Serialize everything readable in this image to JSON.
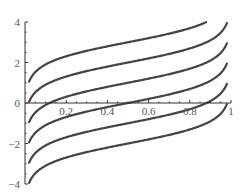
{
  "chart_data": {
    "type": "line",
    "title": "",
    "xlabel": "",
    "ylabel": "",
    "xlim": [
      0,
      1
    ],
    "ylim": [
      -4,
      4
    ],
    "grid": false,
    "legend": null,
    "function": "y = c + 0.5*ln(x/(1-x))",
    "x_ticks": [
      0.2,
      0.4,
      0.6,
      0.8,
      1
    ],
    "x_tick_labels": [
      "0.2",
      "0.4",
      "0.6",
      "0.8",
      "1"
    ],
    "y_ticks": [
      -4,
      -2,
      0,
      2,
      4
    ],
    "y_tick_labels": [
      "−4",
      "−2",
      "0",
      "2",
      "4"
    ],
    "x_domain": [
      0.02,
      0.98
    ],
    "series": [
      {
        "name": "c=3",
        "offset": 3,
        "x": [
          0.02,
          0.1,
          0.2,
          0.36,
          0.5,
          0.7,
          0.88
        ],
        "values": [
          1.05,
          1.9,
          2.31,
          2.71,
          3.0,
          3.42,
          4.0
        ]
      },
      {
        "name": "c=2",
        "offset": 2,
        "x": [
          0.02,
          0.1,
          0.2,
          0.36,
          0.5,
          0.7,
          0.9,
          0.98
        ],
        "values": [
          0.05,
          0.9,
          1.31,
          1.71,
          2.0,
          2.42,
          3.1,
          3.95
        ]
      },
      {
        "name": "c=1",
        "offset": 1,
        "x": [
          0.02,
          0.1,
          0.2,
          0.36,
          0.5,
          0.7,
          0.9,
          0.98
        ],
        "values": [
          -0.95,
          -0.1,
          0.31,
          0.71,
          1.0,
          1.42,
          2.1,
          2.95
        ]
      },
      {
        "name": "c=0",
        "offset": 0,
        "x": [
          0.02,
          0.1,
          0.2,
          0.36,
          0.5,
          0.7,
          0.9,
          0.98
        ],
        "values": [
          -1.95,
          -1.1,
          -0.69,
          -0.29,
          0.0,
          0.42,
          1.1,
          1.95
        ]
      },
      {
        "name": "c=-1",
        "offset": -1,
        "x": [
          0.02,
          0.1,
          0.2,
          0.36,
          0.5,
          0.7,
          0.9,
          0.98
        ],
        "values": [
          -2.95,
          -2.1,
          -1.69,
          -1.29,
          -1.0,
          -0.58,
          0.1,
          0.95
        ]
      },
      {
        "name": "c=-2",
        "offset": -2,
        "x": [
          0.02,
          0.1,
          0.2,
          0.36,
          0.5,
          0.7,
          0.9,
          0.98
        ],
        "values": [
          -3.95,
          -3.1,
          -2.69,
          -2.29,
          -2.0,
          -1.58,
          -0.9,
          -0.05
        ]
      }
    ]
  },
  "layout": {
    "origin_px": [
      25,
      103
    ],
    "x_scale_px": 206,
    "y_scale_px": 20.25,
    "curve_color": "#444444",
    "axis_color": "#333333"
  }
}
